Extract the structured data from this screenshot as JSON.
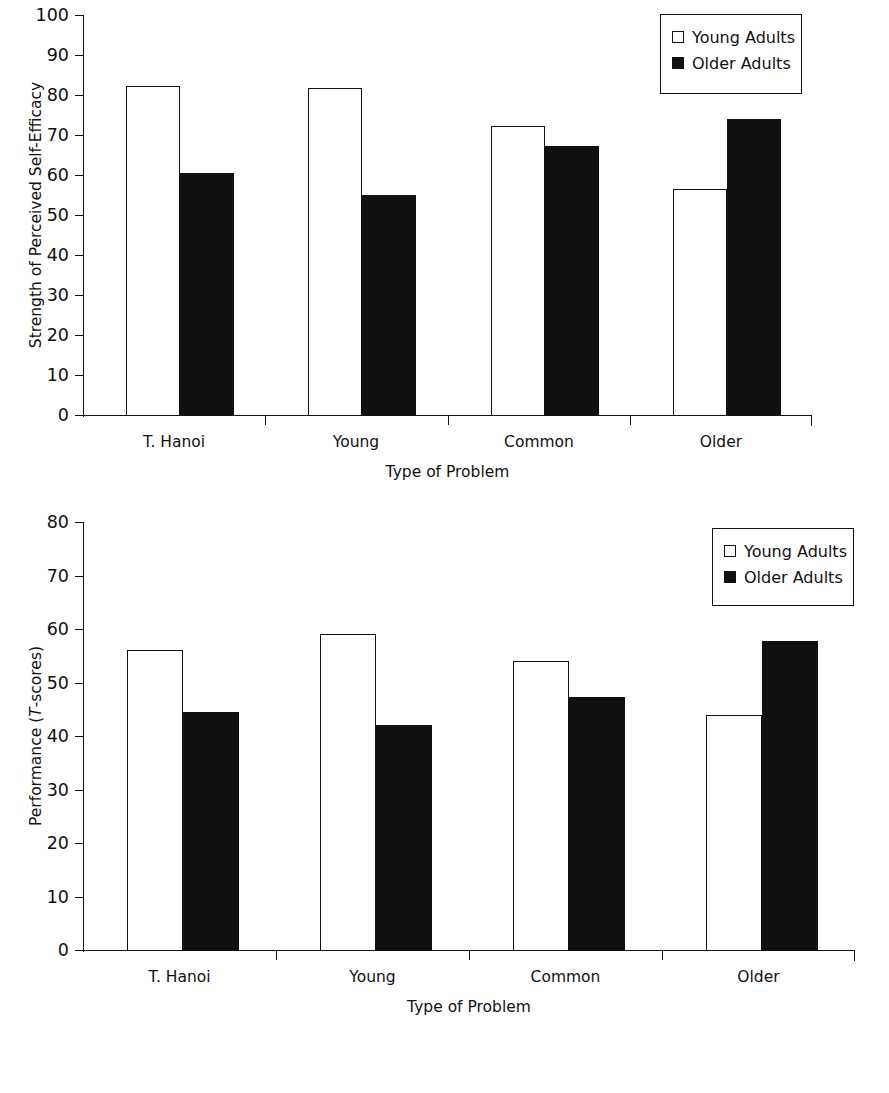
{
  "figure": {
    "legend_entries": [
      {
        "label": "Young Adults",
        "swatch": "white-square-icon",
        "color": "#ffffff"
      },
      {
        "label": "Older Adults",
        "swatch": "black-square-icon",
        "color": "#000000"
      }
    ],
    "categories": [
      "T. Hanoi",
      "Young",
      "Common",
      "Older"
    ],
    "xlabel": "Type of Problem"
  },
  "chart_data": [
    {
      "type": "bar",
      "id": "self-efficacy",
      "title": "",
      "xlabel": "Type of Problem",
      "ylabel": "Strength of Perceived Self-Efficacy",
      "categories": [
        "T. Hanoi",
        "Young",
        "Common",
        "Older"
      ],
      "series": [
        {
          "name": "Young Adults",
          "values": [
            82.3,
            81.8,
            72.3,
            56.5
          ]
        },
        {
          "name": "Older Adults",
          "values": [
            60.5,
            55.0,
            67.3,
            74.0
          ]
        }
      ],
      "ylim": [
        0,
        100
      ],
      "yticks": [
        0,
        10,
        20,
        30,
        40,
        50,
        60,
        70,
        80,
        90,
        100
      ],
      "ytick_labels": [
        "0",
        "10",
        "20",
        "30",
        "40",
        "50",
        "60",
        "70",
        "80",
        "90",
        "100"
      ],
      "grid": false,
      "legend_position": "top-right"
    },
    {
      "type": "bar",
      "id": "performance",
      "title": "",
      "xlabel": "Type of Problem",
      "ylabel": "Performance (T-scores)",
      "ylabel_parts": {
        "pre": "Performance (",
        "italic": "T",
        "post": "-scores)"
      },
      "categories": [
        "T. Hanoi",
        "Young",
        "Common",
        "Older"
      ],
      "series": [
        {
          "name": "Young Adults",
          "values": [
            56.0,
            59.0,
            54.0,
            44.0
          ]
        },
        {
          "name": "Older Adults",
          "values": [
            44.5,
            42.0,
            47.3,
            57.7
          ]
        }
      ],
      "ylim": [
        0,
        80
      ],
      "yticks": [
        0,
        10,
        20,
        30,
        40,
        50,
        60,
        70,
        80
      ],
      "ytick_labels": [
        "0",
        "10",
        "20",
        "30",
        "40",
        "50",
        "60",
        "70",
        "80"
      ],
      "grid": false,
      "legend_position": "top-right"
    }
  ]
}
